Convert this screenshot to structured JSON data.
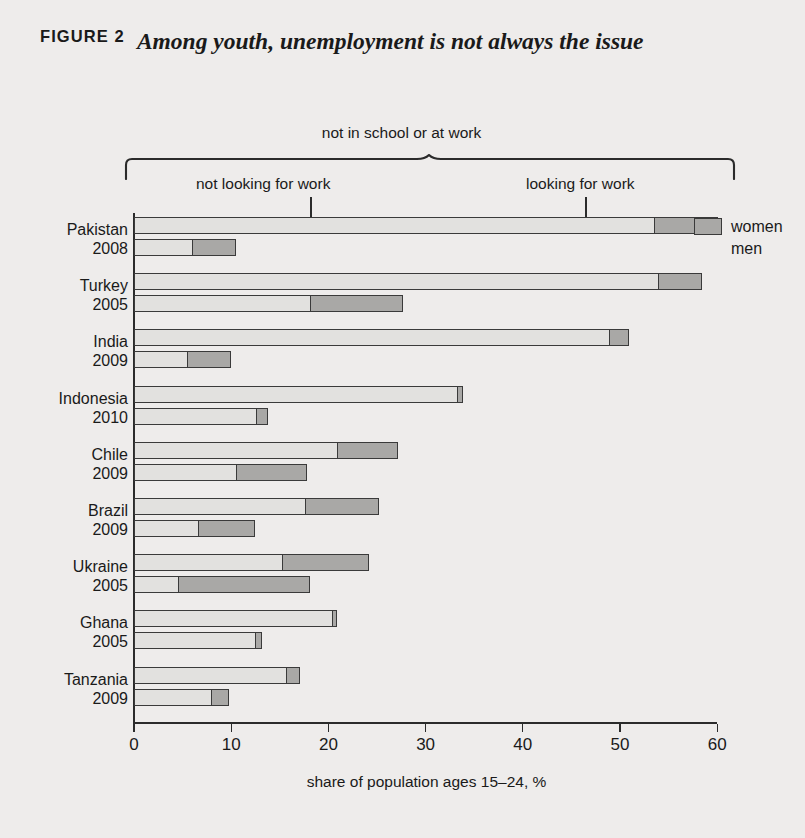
{
  "figure": {
    "label": "FIGURE 2",
    "title": "Among youth, unemployment is not always the issue"
  },
  "annotations": {
    "top_bracket": "not in school or at work",
    "left_segment": "not looking for work",
    "right_segment": "looking for work"
  },
  "legend": {
    "women": "women",
    "men": "men"
  },
  "colors": {
    "background": "#eeeceb",
    "light_segment": "#e2e1df",
    "dark_segment": "#a9a8a6",
    "ink": "#2b2b2b"
  },
  "chart_data": {
    "type": "bar",
    "orientation": "horizontal",
    "title": "Among youth, unemployment is not always the issue",
    "xlabel": "share of population ages 15–24, %",
    "ylabel": "",
    "xlim": [
      0,
      60
    ],
    "xticks": [
      0,
      10,
      20,
      30,
      40,
      50,
      60
    ],
    "xticklabels": [
      "0",
      "10",
      "20",
      "30",
      "40",
      "50",
      "60"
    ],
    "grid": false,
    "stacked": true,
    "legend_position": "right",
    "segment_names": [
      "not looking for work",
      "looking for work"
    ],
    "bracket_label": "not in school or at work",
    "categories": [
      {
        "country": "Pakistan",
        "year": "2008"
      },
      {
        "country": "Turkey",
        "year": "2005"
      },
      {
        "country": "India",
        "year": "2009"
      },
      {
        "country": "Indonesia",
        "year": "2010"
      },
      {
        "country": "Chile",
        "year": "2009"
      },
      {
        "country": "Brazil",
        "year": "2009"
      },
      {
        "country": "Ukraine",
        "year": "2005"
      },
      {
        "country": "Ghana",
        "year": "2005"
      },
      {
        "country": "Tanzania",
        "year": "2009"
      }
    ],
    "series": [
      {
        "name": "women",
        "not_looking_for_work": [
          53.6,
          54.0,
          49.0,
          33.3,
          20.9,
          17.6,
          15.3,
          20.5,
          15.7
        ],
        "looking_for_work": [
          6.5,
          4.4,
          1.9,
          0.5,
          6.3,
          7.6,
          8.9,
          0.4,
          1.4
        ],
        "total": [
          60.1,
          58.4,
          50.9,
          33.8,
          27.2,
          25.2,
          24.2,
          20.9,
          17.1
        ]
      },
      {
        "name": "men",
        "not_looking_for_work": [
          6.0,
          18.1,
          5.5,
          12.6,
          10.5,
          6.6,
          4.5,
          12.5,
          8.0
        ],
        "looking_for_work": [
          4.5,
          9.6,
          4.5,
          1.2,
          7.3,
          5.8,
          13.6,
          0.7,
          1.8
        ],
        "total": [
          10.5,
          27.7,
          10.0,
          13.8,
          17.8,
          12.4,
          18.1,
          13.2,
          9.8
        ]
      }
    ]
  }
}
